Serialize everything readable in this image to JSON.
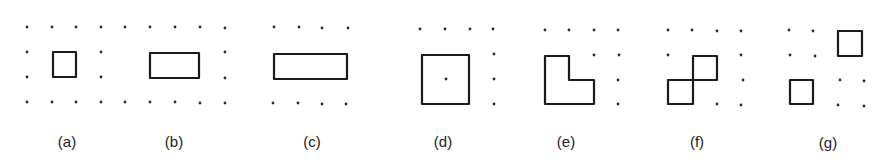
{
  "figure": {
    "stroke_color": "#1a1a1a",
    "dot_color": "#2a2a2a",
    "background": "#ffffff",
    "panels": [
      {
        "id": "a",
        "label": "(a)",
        "label_pos": [
          67,
          147
        ],
        "dots": [
          [
            27,
            27
          ],
          [
            52,
            27
          ],
          [
            76,
            27
          ],
          [
            101,
            27
          ],
          [
            27,
            52
          ],
          [
            101,
            52
          ],
          [
            27,
            77
          ],
          [
            101,
            77
          ],
          [
            27,
            102
          ],
          [
            52,
            102
          ],
          [
            76,
            102
          ],
          [
            101,
            102
          ]
        ],
        "shapes": [
          {
            "type": "polygon",
            "points": [
              [
                53,
                52
              ],
              [
                76,
                52
              ],
              [
                76,
                77
              ],
              [
                53,
                77
              ]
            ]
          }
        ]
      },
      {
        "id": "b",
        "label": "(b)",
        "label_pos": [
          174,
          147
        ],
        "dots": [
          [
            125,
            27
          ],
          [
            150,
            27
          ],
          [
            175,
            27
          ],
          [
            200,
            27
          ],
          [
            225,
            28
          ],
          [
            225,
            52
          ],
          [
            225,
            78
          ],
          [
            125,
            102
          ],
          [
            150,
            102
          ],
          [
            175,
            102
          ],
          [
            200,
            103
          ],
          [
            225,
            103
          ]
        ],
        "shapes": [
          {
            "type": "polygon",
            "points": [
              [
                150,
                53
              ],
              [
                199,
                53
              ],
              [
                199,
                78
              ],
              [
                150,
                78
              ]
            ]
          }
        ]
      },
      {
        "id": "c",
        "label": "(c)",
        "label_pos": [
          312,
          147
        ],
        "dots": [
          [
            274,
            27
          ],
          [
            299,
            27
          ],
          [
            322,
            28
          ],
          [
            348,
            28
          ],
          [
            273,
            103
          ],
          [
            298,
            103
          ],
          [
            322,
            104
          ],
          [
            346,
            104
          ]
        ],
        "shapes": [
          {
            "type": "polygon",
            "points": [
              [
                274,
                54
              ],
              [
                347,
                54
              ],
              [
                347,
                79
              ],
              [
                274,
                79
              ]
            ]
          }
        ]
      },
      {
        "id": "d",
        "label": "(d)",
        "label_pos": [
          443,
          147
        ],
        "dots": [
          [
            420,
            29
          ],
          [
            445,
            29
          ],
          [
            470,
            29
          ],
          [
            493,
            29
          ],
          [
            494,
            54
          ],
          [
            446,
            79
          ],
          [
            494,
            79
          ],
          [
            494,
            104
          ]
        ],
        "shapes": [
          {
            "type": "polygon",
            "points": [
              [
                422,
                55
              ],
              [
                469,
                55
              ],
              [
                469,
                104
              ],
              [
                422,
                104
              ]
            ]
          }
        ]
      },
      {
        "id": "e",
        "label": "(e)",
        "label_pos": [
          566,
          147
        ],
        "dots": [
          [
            545,
            30
          ],
          [
            569,
            30
          ],
          [
            594,
            30
          ],
          [
            618,
            30
          ],
          [
            594,
            55
          ],
          [
            619,
            55
          ],
          [
            618,
            80
          ],
          [
            618,
            104
          ]
        ],
        "shapes": [
          {
            "type": "polygon",
            "points": [
              [
                545,
                56
              ],
              [
                569,
                56
              ],
              [
                569,
                80
              ],
              [
                594,
                80
              ],
              [
                594,
                104
              ],
              [
                545,
                104
              ]
            ]
          }
        ]
      },
      {
        "id": "f",
        "label": "(f)",
        "label_pos": [
          697,
          147
        ],
        "dots": [
          [
            668,
            30
          ],
          [
            692,
            30
          ],
          [
            717,
            31
          ],
          [
            741,
            31
          ],
          [
            668,
            55
          ],
          [
            741,
            55
          ],
          [
            743,
            80
          ],
          [
            717,
            104
          ],
          [
            741,
            105
          ]
        ],
        "shapes": [
          {
            "type": "polygon",
            "points": [
              [
                668,
                80
              ],
              [
                693,
                80
              ],
              [
                693,
                104
              ],
              [
                668,
                104
              ]
            ]
          },
          {
            "type": "polygon",
            "points": [
              [
                693,
                56
              ],
              [
                717,
                56
              ],
              [
                717,
                80
              ],
              [
                693,
                80
              ]
            ]
          }
        ]
      },
      {
        "id": "g",
        "label": "(g)",
        "label_pos": [
          828,
          148
        ],
        "dots": [
          [
            789,
            30
          ],
          [
            813,
            31
          ],
          [
            790,
            55
          ],
          [
            815,
            56
          ],
          [
            840,
            80
          ],
          [
            864,
            81
          ],
          [
            838,
            105
          ],
          [
            864,
            106
          ]
        ],
        "shapes": [
          {
            "type": "polygon",
            "points": [
              [
                838,
                31
              ],
              [
                862,
                31
              ],
              [
                862,
                56
              ],
              [
                838,
                56
              ]
            ]
          },
          {
            "type": "polygon",
            "points": [
              [
                790,
                80
              ],
              [
                813,
                80
              ],
              [
                813,
                104
              ],
              [
                790,
                104
              ]
            ]
          }
        ]
      }
    ]
  }
}
